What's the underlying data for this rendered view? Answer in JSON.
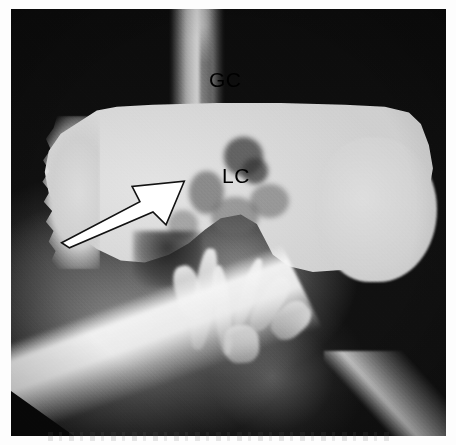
{
  "figure": {
    "modality": "barium contrast radiograph",
    "orientation": "frontal",
    "background_color": "#0d0d0d",
    "plate_tone": "#d8d8d8",
    "annotation_color": "#000000",
    "arrow_fill": "#ffffff",
    "arrow_outline": "#000000"
  },
  "annotations": {
    "labels": [
      {
        "id": "gc",
        "text": "GC",
        "meaning": "greater curvature",
        "x_pct": 45.5,
        "y_pct": 14.0
      },
      {
        "id": "lc",
        "text": "LC",
        "meaning": "lesser curvature",
        "x_pct": 48.5,
        "y_pct": 36.5
      }
    ],
    "arrow": {
      "id": "lesion-arrow",
      "direction": "up-right",
      "tail_x_pct": 4,
      "tail_y_pct": 92,
      "tip_x_pct": 96,
      "tip_y_pct": 10
    }
  }
}
